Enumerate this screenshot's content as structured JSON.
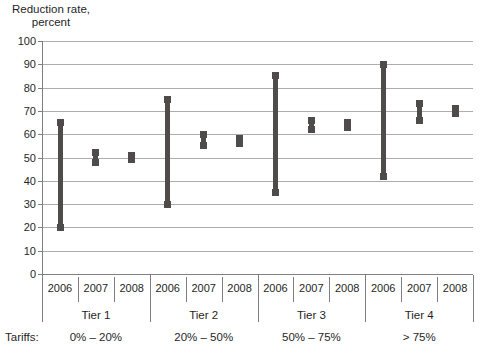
{
  "chart_data": {
    "type": "range-bar",
    "title_lines": [
      "Reduction rate,",
      "percent"
    ],
    "ylim": [
      0,
      100
    ],
    "ytick_step": 10,
    "grid": true,
    "legend": "none",
    "x_axis_caption": "Tariffs:",
    "groups": [
      {
        "tier": "Tier 1",
        "tariffs": "0% – 20%",
        "bars": [
          {
            "year": "2006",
            "low": 20,
            "high": 65
          },
          {
            "year": "2007",
            "low": 48,
            "high": 52
          },
          {
            "year": "2008",
            "low": 49,
            "high": 51
          }
        ]
      },
      {
        "tier": "Tier 2",
        "tariffs": "20% – 50%",
        "bars": [
          {
            "year": "2006",
            "low": 30,
            "high": 75
          },
          {
            "year": "2007",
            "low": 55,
            "high": 60
          },
          {
            "year": "2008",
            "low": 56,
            "high": 58
          }
        ]
      },
      {
        "tier": "Tier 3",
        "tariffs": "50% – 75%",
        "bars": [
          {
            "year": "2006",
            "low": 35,
            "high": 85
          },
          {
            "year": "2007",
            "low": 62,
            "high": 66
          },
          {
            "year": "2008",
            "low": 63,
            "high": 65
          }
        ]
      },
      {
        "tier": "Tier 4",
        "tariffs": "> 75%",
        "bars": [
          {
            "year": "2006",
            "low": 42,
            "high": 90
          },
          {
            "year": "2007",
            "low": 66,
            "high": 73
          },
          {
            "year": "2008",
            "low": 69,
            "high": 71
          }
        ]
      }
    ],
    "colors": {
      "bar": "#4f4b4b",
      "gridline": "#adadad",
      "axis": "#7f7f7f",
      "text": "#1f1f1f"
    }
  }
}
